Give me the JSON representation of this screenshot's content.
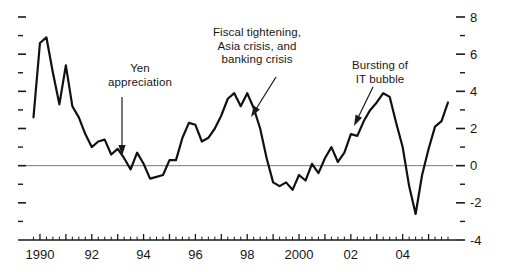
{
  "chart_data": {
    "type": "line",
    "title": "",
    "subtitle": "",
    "xlabel": "",
    "ylabel": "",
    "grid": false,
    "legend": "none",
    "xlim": [
      1989.5,
      2005.75
    ],
    "ylim": [
      -4,
      8
    ],
    "y_ticks_labeled": [
      8,
      6,
      4,
      2,
      0,
      -2,
      -4
    ],
    "y_ticks_minor": [
      7,
      5,
      3,
      1,
      -1,
      -3
    ],
    "x_ticks_labeled": [
      "1990",
      "92",
      "94",
      "96",
      "98",
      "2000",
      "02",
      "04"
    ],
    "x_tick_values": [
      1990,
      1992,
      1994,
      1996,
      1998,
      2000,
      2002,
      2004
    ],
    "x_minor_tick_interval": 0.25,
    "zero_line": 0,
    "series": [
      {
        "name": "growth rate",
        "color": "#111111",
        "x": [
          1989.75,
          1990.0,
          1990.25,
          1990.5,
          1990.75,
          1991.0,
          1991.25,
          1991.5,
          1991.75,
          1992.0,
          1992.25,
          1992.5,
          1992.75,
          1993.0,
          1993.25,
          1993.5,
          1993.75,
          1994.0,
          1994.25,
          1994.5,
          1994.75,
          1995.0,
          1995.25,
          1995.5,
          1995.75,
          1996.0,
          1996.25,
          1996.5,
          1996.75,
          1997.0,
          1997.25,
          1997.5,
          1997.75,
          1998.0,
          1998.25,
          1998.5,
          1998.75,
          1999.0,
          1999.25,
          1999.5,
          1999.75,
          2000.0,
          2000.25,
          2000.5,
          2000.75,
          2001.0,
          2001.25,
          2001.5,
          2001.75,
          2002.0,
          2002.25,
          2002.5,
          2002.75,
          2003.0,
          2003.25,
          2003.5,
          2003.75,
          2004.0,
          2004.25,
          2004.5,
          2004.75,
          2005.0,
          2005.25,
          2005.5
        ],
        "y": [
          2.6,
          6.6,
          6.9,
          5.0,
          3.3,
          5.4,
          3.2,
          2.6,
          1.7,
          1.0,
          1.3,
          1.4,
          0.6,
          0.9,
          0.4,
          -0.2,
          0.7,
          0.1,
          -0.7,
          -0.6,
          -0.5,
          0.3,
          0.3,
          1.5,
          2.3,
          2.2,
          1.3,
          1.5,
          2.0,
          2.7,
          3.6,
          3.9,
          3.2,
          3.9,
          3.1,
          2.0,
          0.4,
          -0.9,
          -1.1,
          -0.9,
          -1.3,
          -0.5,
          -0.8,
          0.1,
          -0.4,
          0.4,
          1.0,
          0.2,
          0.7,
          1.7,
          1.6,
          2.4,
          3.0,
          3.4,
          3.9,
          3.7,
          2.3,
          1.0,
          -1.1,
          -2.6,
          -0.5,
          0.9,
          2.1,
          2.4
        ],
        "y_tail": [
          3.4,
          4.0,
          4.2,
          3.9,
          3.9,
          3.2,
          2.6,
          2.3,
          2.1,
          1.9
        ]
      }
    ],
    "annotations": [
      {
        "id": "yen-appreciation",
        "lines": [
          "Yen",
          "appreciation"
        ],
        "text_x": 140,
        "text_y": 62,
        "arrow": {
          "x1": 122,
          "y1": 97,
          "x2": 122,
          "y2": 156,
          "style": "vertical"
        }
      },
      {
        "id": "fiscal-tightening",
        "lines": [
          "Fiscal tightening,",
          "Asia crisis, and",
          "banking crisis"
        ],
        "text_x": 257,
        "text_y": 26,
        "arrow": {
          "x1": 276,
          "y1": 77,
          "x2": 251,
          "y2": 117,
          "style": "diagonal"
        }
      },
      {
        "id": "it-bubble",
        "lines": [
          "Bursting of",
          "IT bubble"
        ],
        "text_x": 380,
        "text_y": 59,
        "arrow": {
          "x1": 373,
          "y1": 87,
          "x2": 354,
          "y2": 126,
          "style": "diagonal"
        }
      }
    ]
  },
  "colors": {
    "line": "#111111",
    "axis": "#1a1a1a",
    "zero_line": "#7a7a7a",
    "text": "#171717",
    "background": "#ffffff"
  }
}
